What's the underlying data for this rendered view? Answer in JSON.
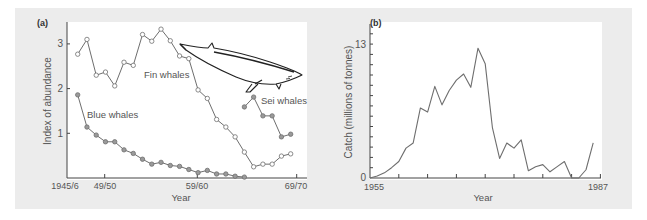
{
  "chart_data": [
    {
      "panel": "(a)",
      "type": "line",
      "title": "",
      "xlabel": "Year",
      "ylabel": "Index of abundance",
      "x_ticks": [
        "1945/6",
        "49/50",
        "59/60",
        "69/70"
      ],
      "y_ticks": [
        1,
        2,
        3
      ],
      "ylim": [
        0,
        3.4
      ],
      "grid": false,
      "legend": "inline labels",
      "x": [
        "1946/47",
        "1947/48",
        "1948/49",
        "1949/50",
        "1950/51",
        "1951/52",
        "1952/53",
        "1953/54",
        "1954/55",
        "1955/56",
        "1956/57",
        "1957/58",
        "1958/59",
        "1959/60",
        "1960/61",
        "1961/62",
        "1962/63",
        "1963/64",
        "1964/65",
        "1965/66",
        "1966/67",
        "1967/68",
        "1968/69",
        "1969/70"
      ],
      "series": [
        {
          "name": "Fin whales",
          "marker": "hollow-circle",
          "start_index": 0,
          "values": [
            2.77,
            3.1,
            2.3,
            2.37,
            2.06,
            2.59,
            2.52,
            3.21,
            3.06,
            3.33,
            3.07,
            2.73,
            2.67,
            1.97,
            1.78,
            1.31,
            1.14,
            0.92,
            0.58,
            0.25,
            0.31,
            0.31,
            0.49,
            0.54
          ]
        },
        {
          "name": "Blue whales",
          "marker": "filled-circle",
          "start_index": 0,
          "values": [
            1.86,
            1.14,
            0.96,
            0.81,
            0.81,
            0.63,
            0.55,
            0.42,
            0.31,
            0.35,
            0.28,
            0.26,
            0.19,
            0.12,
            0.17,
            0.09,
            0.09,
            0.04,
            0.02
          ]
        },
        {
          "name": "Sei whales",
          "marker": "filled-circle",
          "start_index": 18,
          "values": [
            1.59,
            1.81,
            1.39,
            1.39,
            0.92,
            0.98
          ]
        }
      ],
      "annotations": [
        "Fin whales",
        "Blue whales",
        "Sei whales",
        "whale illustration"
      ]
    },
    {
      "panel": "(b)",
      "type": "line",
      "title": "",
      "xlabel": "Year",
      "ylabel": "Catch (millions of tonnes)",
      "x_ticks": [
        "1955",
        "1987"
      ],
      "y_ticks": [
        0,
        13
      ],
      "ylim": [
        0,
        14
      ],
      "xlim": [
        1955,
        1987
      ],
      "grid": false,
      "x": [
        1955,
        1956,
        1957,
        1958,
        1959,
        1960,
        1961,
        1962,
        1963,
        1964,
        1965,
        1966,
        1967,
        1968,
        1969,
        1970,
        1971,
        1972,
        1973,
        1974,
        1975,
        1976,
        1977,
        1978,
        1979,
        1980,
        1981,
        1982,
        1983,
        1984,
        1985,
        1986
      ],
      "series": [
        {
          "name": "Catch",
          "values": [
            0.0,
            0.2,
            0.5,
            1.0,
            1.6,
            2.9,
            3.4,
            6.8,
            6.4,
            8.9,
            7.1,
            8.5,
            9.5,
            10.1,
            8.8,
            12.6,
            11.1,
            4.9,
            1.9,
            3.4,
            2.9,
            3.7,
            0.7,
            1.1,
            1.3,
            0.6,
            1.1,
            1.6,
            0.0,
            0.0,
            0.8,
            3.4
          ]
        }
      ]
    }
  ],
  "panels": {
    "a": {
      "tag": "(a)",
      "ylabel": "Index of abundance",
      "xlabel": "Year",
      "xtick_labels": [
        "1945/6",
        "49/50",
        "59/60",
        "69/70"
      ],
      "ytick_labels": [
        "1",
        "2",
        "3"
      ],
      "labels": {
        "fin": "Fin whales",
        "blue": "Blue whales",
        "sei": "Sei whales"
      }
    },
    "b": {
      "tag": "(b)",
      "ylabel": "Catch (millions of tonnes)",
      "xlabel": "Year",
      "xtick_labels": [
        "1955",
        "1987"
      ],
      "ytick_labels": [
        "0",
        "13"
      ]
    }
  },
  "colors": {
    "line": "#6e6e6e",
    "marker_fill": "#9a9a9a",
    "axis": "#444444",
    "panel_bg": "#ececec"
  }
}
